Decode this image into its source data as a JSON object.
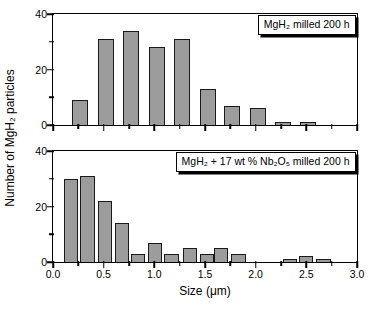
{
  "figure": {
    "xlabel": "Size (μm)",
    "ylabel": "Number of MgH₂ particles"
  },
  "axes": {
    "x": {
      "min": 0,
      "max": 3,
      "major_ticks": [
        0,
        0.5,
        1.0,
        1.5,
        2.0,
        2.5,
        3.0
      ],
      "major_tick_labels": [
        "0.0",
        "0.5",
        "1.0",
        "1.5",
        "2.0",
        "2.5",
        "3.0"
      ],
      "minor_tick_step": 0.25
    },
    "y": {
      "min": 0,
      "max": 40,
      "major_ticks": [
        0,
        20,
        40
      ],
      "major_tick_labels": [
        "0",
        "20",
        "40"
      ],
      "minor_ticks": [
        10,
        30
      ]
    }
  },
  "chart_data": [
    {
      "type": "bar",
      "annotation": "MgH₂ milled 200 h",
      "xlabel": "Size (μm)",
      "ylabel": "Number of MgH₂ particles",
      "xlim": [
        0,
        3
      ],
      "ylim": [
        0,
        40
      ],
      "grid": false,
      "bar_width_um": 0.16,
      "x": [
        0.27,
        0.52,
        0.77,
        1.03,
        1.27,
        1.53,
        1.77,
        2.02,
        2.27,
        2.52
      ],
      "values": [
        9,
        31,
        34,
        28,
        31,
        13,
        7,
        6,
        1,
        1
      ]
    },
    {
      "type": "bar",
      "annotation": "MgH₂ + 17 wt % Nb₂O₅ milled 200 h",
      "xlabel": "Size (μm)",
      "ylabel": "Number of MgH₂ particles",
      "xlim": [
        0,
        3
      ],
      "ylim": [
        0,
        40
      ],
      "grid": false,
      "bar_width_um": 0.14,
      "x": [
        0.18,
        0.34,
        0.51,
        0.68,
        0.84,
        1.01,
        1.17,
        1.35,
        1.52,
        1.66,
        1.83,
        2.34,
        2.5,
        2.67
      ],
      "values": [
        30,
        31,
        22,
        14,
        3,
        7,
        3,
        5,
        3,
        5,
        3,
        1,
        2,
        1
      ]
    }
  ],
  "style": {
    "bar_fill": "#9c9c9c",
    "bar_border": "#1a1a1a",
    "axis_color": "#000000",
    "background": "#ffffff",
    "legend_shadow": "#000000"
  }
}
